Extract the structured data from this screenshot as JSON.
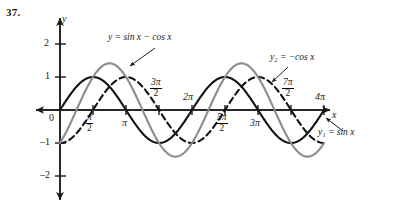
{
  "problem_number": "37.",
  "chart_data": {
    "type": "line",
    "title": "",
    "xlabel": "x",
    "ylabel": "y",
    "xlim": [
      -0.6,
      13.2
    ],
    "ylim": [
      -2.6,
      2.45
    ],
    "grid": false,
    "legend": "inline-annotations",
    "x_tick_labels": [
      "0",
      "π/2",
      "π",
      "3π/2",
      "2π",
      "5π/2",
      "3π",
      "7π/2",
      "4π"
    ],
    "x_tick_values": [
      0,
      1.5708,
      3.1416,
      4.7124,
      6.2832,
      7.854,
      9.4248,
      10.9956,
      12.5664
    ],
    "y_tick_labels": [
      "2",
      "1",
      "-1",
      "-2"
    ],
    "y_tick_values": [
      2,
      1,
      -1,
      -2
    ],
    "series": [
      {
        "name": "y1 = sin x",
        "label": "y₁ = sin x",
        "expression": "sin(x)",
        "style": "solid",
        "color": "#111111",
        "width": 2.1,
        "amplitude": 1,
        "phase_deg": 0,
        "key_points": [
          {
            "x": 0,
            "y": 0
          },
          {
            "x": 1.5708,
            "y": 1
          },
          {
            "x": 3.1416,
            "y": 0
          },
          {
            "x": 4.7124,
            "y": -1
          },
          {
            "x": 6.2832,
            "y": 0
          },
          {
            "x": 7.854,
            "y": 1
          },
          {
            "x": 9.4248,
            "y": 0
          },
          {
            "x": 10.9956,
            "y": -1
          },
          {
            "x": 12.5664,
            "y": 0
          }
        ]
      },
      {
        "name": "y2 = -cos x",
        "label": "y₂ = −cos x",
        "expression": "-cos(x)",
        "style": "dashed",
        "color": "#111111",
        "width": 2.1,
        "amplitude": 1,
        "phase_deg": -90,
        "key_points": [
          {
            "x": 0,
            "y": -1
          },
          {
            "x": 1.5708,
            "y": 0
          },
          {
            "x": 3.1416,
            "y": 1
          },
          {
            "x": 4.7124,
            "y": 0
          },
          {
            "x": 6.2832,
            "y": -1
          },
          {
            "x": 7.854,
            "y": 0
          },
          {
            "x": 9.4248,
            "y": 1
          },
          {
            "x": 10.9956,
            "y": 0
          },
          {
            "x": 12.5664,
            "y": -1
          }
        ]
      },
      {
        "name": "y = sin x - cos x",
        "label": "y = sin x − cos x",
        "expression": "sin(x) - cos(x)",
        "style": "solid",
        "color": "#8c8c8c",
        "width": 2.1,
        "amplitude": 1.4142,
        "phase_deg": -45,
        "key_points": [
          {
            "x": 0,
            "y": -1
          },
          {
            "x": 0.7854,
            "y": 0
          },
          {
            "x": 2.3562,
            "y": 1.414
          },
          {
            "x": 3.927,
            "y": 0
          },
          {
            "x": 5.4978,
            "y": -1.414
          },
          {
            "x": 7.0686,
            "y": 0
          },
          {
            "x": 8.6394,
            "y": 1.414
          },
          {
            "x": 10.2102,
            "y": 0
          },
          {
            "x": 11.781,
            "y": -1.414
          },
          {
            "x": 12.5664,
            "y": -1
          }
        ]
      }
    ],
    "annotations": [
      {
        "text": "y = sin x − cos x",
        "target_series": "y = sin x - cos x",
        "arrow": true
      },
      {
        "text": "y₂ = −cos x",
        "target_series": "y2 = -cos x",
        "arrow": true
      },
      {
        "text": "y₁ = sin x",
        "target_series": "y1 = sin x",
        "arrow": true
      }
    ]
  },
  "axes": {
    "y_axis_label": "y",
    "x_axis_label": "x",
    "origin_label": "0"
  },
  "ticks": {
    "x": [
      {
        "label_main": "π",
        "label_den": "2",
        "kind": "frac",
        "num_prefix": ""
      },
      {
        "label_main": "π",
        "kind": "plain"
      },
      {
        "label_main": "3π",
        "label_den": "2",
        "kind": "frac"
      },
      {
        "label_main": "2π",
        "kind": "plain"
      },
      {
        "label_main": "5π",
        "label_den": "2",
        "kind": "frac"
      },
      {
        "label_main": "3π",
        "kind": "plain"
      },
      {
        "label_main": "7π",
        "label_den": "2",
        "kind": "frac"
      },
      {
        "label_main": "4π",
        "kind": "plain"
      }
    ]
  },
  "tick_text": {
    "pi_over_2_num": "π",
    "pi_over_2_den": "2",
    "pi": "π",
    "three_pi_num": "3π",
    "three_pi_den": "2",
    "two_pi": "2π",
    "five_pi_num": "5π",
    "five_pi_den": "2",
    "three_pi_plain": "3π",
    "seven_pi_num": "7π",
    "seven_pi_den": "2",
    "four_pi": "4π",
    "y_two": "2",
    "y_one": "1",
    "y_neg_one": "–1",
    "y_neg_two": "–2",
    "zero": "0"
  },
  "curve_labels": {
    "main": "y = sin x − cos x",
    "cos": "y₂ = −cos x",
    "sin": "y₁ = sin x"
  },
  "colors": {
    "curve_gray": "#8c8c8c",
    "curve_black": "#111111",
    "axis": "#1a1a1a",
    "background": "#ffffff"
  }
}
